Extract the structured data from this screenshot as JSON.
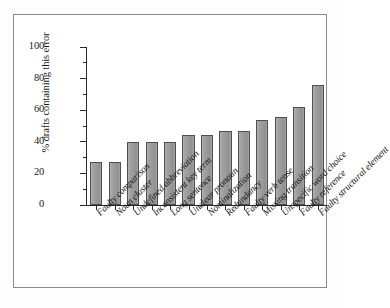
{
  "chart_data": {
    "type": "bar",
    "title": "",
    "xlabel": "",
    "ylabel": "% drafts containing this error",
    "ylim": [
      0,
      100
    ],
    "ytick_labels": [
      "0",
      "20",
      "40",
      "60",
      "80",
      "100"
    ],
    "ytick_values": [
      0,
      20,
      40,
      60,
      80,
      100
    ],
    "grid": false,
    "legend": "none",
    "categories": [
      "Faulty comparison",
      "Noun cluster",
      "Undefined abbreviation",
      "Inconsistent key term",
      "Long sentence",
      "Unclear pronoun",
      "Nominalization",
      "Redundancy",
      "Faulty verb tense",
      "Missing transition",
      "Unspecific word choice",
      "Faulty reference",
      "Faulty structural element"
    ],
    "values": [
      27,
      27,
      40,
      40,
      40,
      44,
      44,
      47,
      47,
      54,
      56,
      62,
      76
    ],
    "bar_color": "#9a9a9a",
    "bar_edge_color": "#4f4f4f",
    "axis_color": "#2a2a2a",
    "background_color": "#ffffff"
  }
}
